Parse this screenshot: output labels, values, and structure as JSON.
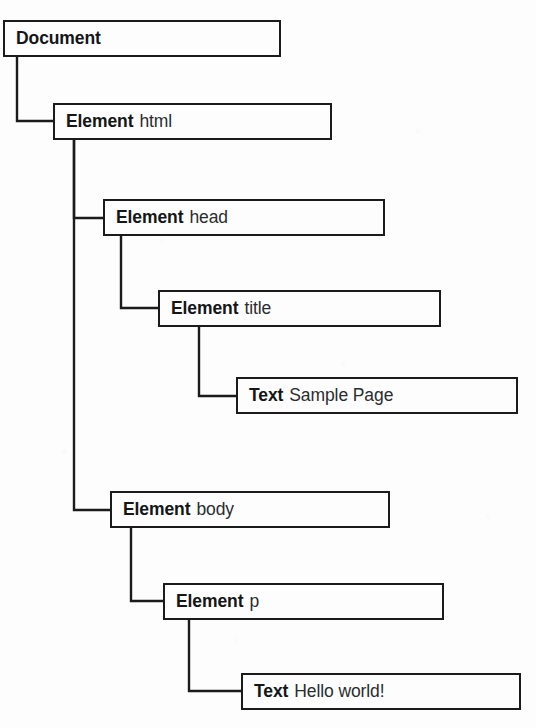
{
  "diagram": {
    "background_color": "#fdfdfd",
    "line_color": "#1b1b1b",
    "text_color": "#16181a",
    "nodes": [
      {
        "id": "document",
        "type_label": "Document",
        "value_label": "",
        "x": 3,
        "y": 20,
        "width": 278,
        "height": 37
      },
      {
        "id": "html",
        "type_label": "Element",
        "value_label": "html",
        "x": 53,
        "y": 103,
        "width": 279,
        "height": 37
      },
      {
        "id": "head",
        "type_label": "Element",
        "value_label": "head",
        "x": 103,
        "y": 199,
        "width": 282,
        "height": 37
      },
      {
        "id": "title",
        "type_label": "Element",
        "value_label": "title",
        "x": 158,
        "y": 290,
        "width": 283,
        "height": 37
      },
      {
        "id": "title-text",
        "type_label": "Text",
        "value_label": "Sample Page",
        "x": 236,
        "y": 377,
        "width": 282,
        "height": 37
      },
      {
        "id": "body",
        "type_label": "Element",
        "value_label": "body",
        "x": 110,
        "y": 491,
        "width": 280,
        "height": 37
      },
      {
        "id": "p",
        "type_label": "Element",
        "value_label": "p",
        "x": 163,
        "y": 583,
        "width": 281,
        "height": 37
      },
      {
        "id": "p-text",
        "type_label": "Text",
        "value_label": "Hello world!",
        "x": 241,
        "y": 673,
        "width": 280,
        "height": 37
      }
    ],
    "edges": [
      {
        "id": "document-to-html",
        "from": "document",
        "to": "html",
        "stem_x": 17,
        "start_y": 57,
        "end_y": 121,
        "end_x": 53
      },
      {
        "id": "html-to-head",
        "from": "html",
        "to": "head",
        "stem_x": 74,
        "start_y": 140,
        "end_y": 218,
        "end_x": 103
      },
      {
        "id": "html-to-body",
        "from": "html",
        "to": "body",
        "stem_x": 74,
        "start_y": 140,
        "end_y": 510,
        "end_x": 110
      },
      {
        "id": "head-to-title",
        "from": "head",
        "to": "title",
        "stem_x": 121,
        "start_y": 236,
        "end_y": 308,
        "end_x": 158
      },
      {
        "id": "title-to-text",
        "from": "title",
        "to": "title-text",
        "stem_x": 199,
        "start_y": 327,
        "end_y": 396,
        "end_x": 236
      },
      {
        "id": "body-to-p",
        "from": "body",
        "to": "p",
        "stem_x": 131,
        "start_y": 528,
        "end_y": 601,
        "end_x": 163
      },
      {
        "id": "p-to-text",
        "from": "p",
        "to": "p-text",
        "stem_x": 189,
        "start_y": 620,
        "end_y": 691,
        "end_x": 241
      }
    ]
  }
}
